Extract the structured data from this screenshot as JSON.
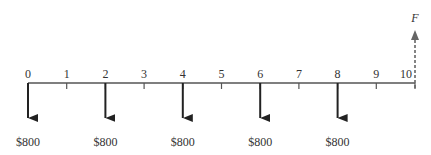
{
  "diagram": {
    "type": "cash-flow-diagram",
    "periods": [
      "0",
      "1",
      "2",
      "3",
      "4",
      "5",
      "6",
      "7",
      "8",
      "9",
      "10"
    ],
    "outflows": [
      {
        "period": 0,
        "label": "$800"
      },
      {
        "period": 2,
        "label": "$800"
      },
      {
        "period": 4,
        "label": "$800"
      },
      {
        "period": 6,
        "label": "$800"
      },
      {
        "period": 8,
        "label": "$800"
      }
    ],
    "future_value": {
      "period": 10,
      "label": "F",
      "style": "dashed"
    },
    "colors": {
      "axis": "#555555",
      "arrow": "#222222",
      "dashed_arrow": "#666666"
    }
  }
}
